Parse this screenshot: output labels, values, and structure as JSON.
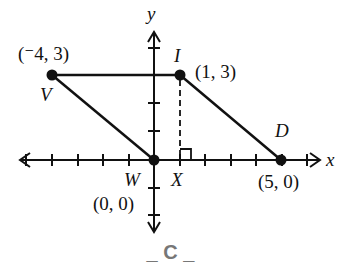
{
  "figure": {
    "caption": "_ C _",
    "axes": {
      "x_label": "x",
      "y_label": "y",
      "x_ticks": [
        -6,
        -5,
        -4,
        -3,
        -2,
        -1,
        1,
        2,
        3,
        4,
        5,
        6
      ],
      "y_ticks": [
        -2,
        -1,
        1,
        2,
        3,
        4
      ]
    },
    "points": [
      {
        "name": "V",
        "coords_label": "(⁻4, 3)",
        "x": -4,
        "y": 3
      },
      {
        "name": "I",
        "coords_label": "(1, 3)",
        "x": 1,
        "y": 3
      },
      {
        "name": "D",
        "coords_label": "(5, 0)",
        "x": 5,
        "y": 0
      },
      {
        "name": "W",
        "coords_label": "(0, 0)",
        "x": 0,
        "y": 0
      },
      {
        "name": "X",
        "coords_label": "",
        "x": 1,
        "y": 0
      }
    ],
    "segments": [
      "VI",
      "ID",
      "DW",
      "WV"
    ],
    "altitude": {
      "from": "I",
      "to": "X",
      "style": "dashed",
      "right_angle_marker": true
    }
  }
}
